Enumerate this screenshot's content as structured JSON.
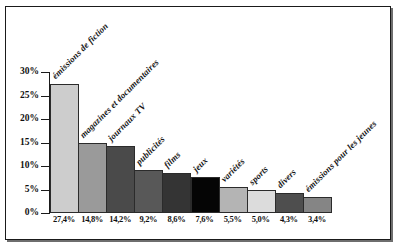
{
  "figure": {
    "frame_color": "#1a1a1a",
    "background": "#ffffff"
  },
  "chart_data": {
    "type": "bar",
    "title": "",
    "subtitle": "",
    "xlabel": "",
    "ylabel": "",
    "ylim": [
      0,
      30
    ],
    "grid": false,
    "legend": "none",
    "orientation": "vertical",
    "bar_gap": 0,
    "axis": {
      "y_ticks": [
        0,
        5,
        10,
        15,
        20,
        25,
        30
      ],
      "y_tick_labels": [
        "0%",
        "5%",
        "10%",
        "15%",
        "20%",
        "25%",
        "30%"
      ],
      "y_tick_suffix": "%"
    },
    "categories": [
      "émissions de fiction",
      "magazines et documentaires",
      "journaux TV",
      "publicités",
      "films",
      "jeux",
      "variétés",
      "sports",
      "divers",
      "émissions pour les jeunes"
    ],
    "values": [
      27.4,
      14.8,
      14.2,
      9.2,
      8.6,
      7.6,
      5.5,
      5.0,
      4.3,
      3.4
    ],
    "data_labels": [
      "27,4%",
      "14,8%",
      "14,2%",
      "9,2%",
      "8,6%",
      "7,6%",
      "5,5%",
      "5,0%",
      "4,3%",
      "3,4%"
    ],
    "colors": [
      "#cdcdcd",
      "#9a9a9a",
      "#4a4a4a",
      "#585858",
      "#343434",
      "#050505",
      "#b4b4b4",
      "#dcdcdc",
      "#4e4e4e",
      "#858585"
    ]
  }
}
